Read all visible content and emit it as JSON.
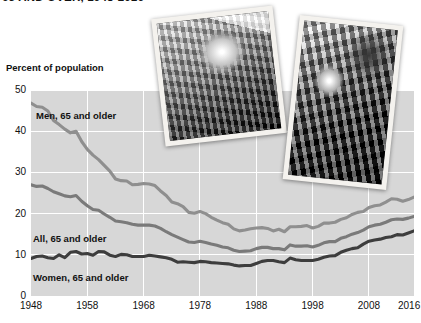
{
  "title": "65 AND OVER, 1948-2016",
  "axes": {
    "y_title": "Percent of population",
    "y_ticks": [
      "50",
      "40",
      "30",
      "20",
      "10",
      "0"
    ],
    "x_ticks": [
      "1948",
      "1958",
      "1968",
      "1978",
      "1988",
      "1998",
      "2008",
      "2016"
    ]
  },
  "series_labels": {
    "men": "Men, 65 and older",
    "all": "All, 65 and older",
    "women": "Women, 65 and older"
  },
  "photos": {
    "photo1_alt": "older-woman-smiling-photo",
    "photo2_alt": "older-man-at-machine-photo"
  },
  "colors": {
    "plot_background": "#d7d7d7",
    "gridline": "#ffffff",
    "men_line": "#8f8f8f",
    "all_line": "#7a7a7a",
    "women_line": "#3d3d3d",
    "text": "#111111"
  },
  "chart_data": {
    "type": "line",
    "title": "65 AND OVER, 1948-2016",
    "xlabel": "",
    "ylabel": "Percent of population",
    "xlim": [
      1948,
      2016
    ],
    "ylim": [
      0,
      50
    ],
    "yticks": [
      0,
      10,
      20,
      30,
      40,
      50
    ],
    "xticks": [
      1948,
      1958,
      1968,
      1978,
      1988,
      1998,
      2008,
      2016
    ],
    "grid": true,
    "legend": "inline-labels",
    "x": [
      1948,
      1949,
      1950,
      1951,
      1952,
      1953,
      1954,
      1955,
      1956,
      1957,
      1958,
      1959,
      1960,
      1961,
      1962,
      1963,
      1964,
      1965,
      1966,
      1967,
      1968,
      1969,
      1970,
      1971,
      1972,
      1973,
      1974,
      1975,
      1976,
      1977,
      1978,
      1979,
      1980,
      1981,
      1982,
      1983,
      1984,
      1985,
      1986,
      1987,
      1988,
      1989,
      1990,
      1991,
      1992,
      1993,
      1994,
      1995,
      1996,
      1997,
      1998,
      1999,
      2000,
      2001,
      2002,
      2003,
      2004,
      2005,
      2006,
      2007,
      2008,
      2009,
      2010,
      2011,
      2012,
      2013,
      2014,
      2015,
      2016
    ],
    "series": [
      {
        "name": "Men, 65 and older",
        "color": "#8f8f8f",
        "values": [
          46.8,
          46.0,
          45.8,
          44.9,
          42.6,
          41.6,
          40.5,
          39.6,
          40.0,
          37.5,
          35.6,
          34.2,
          33.1,
          31.7,
          30.3,
          28.4,
          28.0,
          27.9,
          27.0,
          27.1,
          27.3,
          27.2,
          26.8,
          25.5,
          24.4,
          22.8,
          22.4,
          21.7,
          20.3,
          20.1,
          20.5,
          20.0,
          19.1,
          18.4,
          17.8,
          17.4,
          16.3,
          15.8,
          16.0,
          16.3,
          16.5,
          16.6,
          16.4,
          15.8,
          16.2,
          15.6,
          16.8,
          16.8,
          16.9,
          17.1,
          16.5,
          16.9,
          17.7,
          17.7,
          17.9,
          18.6,
          19.0,
          19.8,
          20.3,
          20.5,
          21.5,
          21.9,
          22.1,
          22.8,
          23.6,
          23.5,
          23.0,
          23.4,
          24.0
        ]
      },
      {
        "name": "All, 65 and older",
        "color": "#7a7a7a",
        "values": [
          27.0,
          26.6,
          26.7,
          26.1,
          25.3,
          24.8,
          24.3,
          24.1,
          24.4,
          23.0,
          21.9,
          21.0,
          20.8,
          19.9,
          19.1,
          18.2,
          18.0,
          17.8,
          17.4,
          17.2,
          17.2,
          17.2,
          17.0,
          16.4,
          15.6,
          14.9,
          14.3,
          13.7,
          13.1,
          13.0,
          13.3,
          13.0,
          12.6,
          12.3,
          11.9,
          11.7,
          11.1,
          10.8,
          10.9,
          11.0,
          11.5,
          11.8,
          11.8,
          11.5,
          11.5,
          11.2,
          12.4,
          12.1,
          12.1,
          12.2,
          11.9,
          12.3,
          12.9,
          13.2,
          13.2,
          14.0,
          14.4,
          15.0,
          15.4,
          16.0,
          16.8,
          17.2,
          17.4,
          17.9,
          18.5,
          18.7,
          18.6,
          18.9,
          19.3
        ]
      },
      {
        "name": "Women, 65 and older",
        "color": "#3d3d3d",
        "values": [
          9.1,
          9.6,
          9.7,
          9.3,
          9.1,
          10.0,
          9.3,
          10.6,
          10.8,
          10.2,
          10.3,
          9.9,
          10.8,
          10.7,
          9.9,
          9.6,
          10.1,
          10.0,
          9.6,
          9.6,
          9.6,
          9.9,
          9.7,
          9.5,
          9.3,
          8.9,
          8.2,
          8.3,
          8.2,
          8.1,
          8.4,
          8.3,
          8.1,
          8.0,
          7.9,
          7.8,
          7.5,
          7.3,
          7.4,
          7.4,
          7.9,
          8.4,
          8.6,
          8.6,
          8.3,
          8.1,
          9.2,
          8.8,
          8.6,
          8.6,
          8.6,
          8.9,
          9.4,
          9.7,
          9.8,
          10.6,
          11.1,
          11.5,
          11.7,
          12.6,
          13.3,
          13.6,
          13.8,
          14.2,
          14.4,
          14.9,
          14.8,
          15.3,
          15.8
        ]
      }
    ]
  }
}
